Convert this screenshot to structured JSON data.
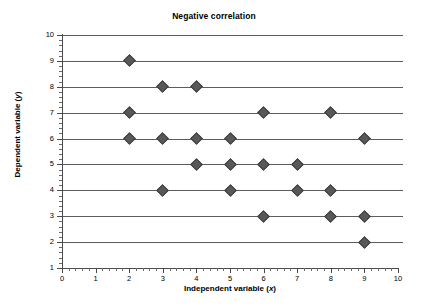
{
  "chart_data": {
    "type": "scatter",
    "title": "Negative correlation",
    "xlabel": "Independent variable (x)",
    "ylabel": "Dependent variable (y)",
    "xlabel_text": "Independent variable (",
    "xlabel_var": "x",
    "ylabel_text": "Dependent variable (",
    "ylabel_var": "y",
    "label_close": ")",
    "xlim": [
      0,
      10
    ],
    "ylim": [
      1,
      10
    ],
    "x_ticks": [
      0,
      1,
      2,
      3,
      4,
      5,
      6,
      7,
      8,
      9,
      10
    ],
    "y_ticks": [
      1,
      2,
      3,
      4,
      5,
      6,
      7,
      8,
      9,
      10
    ],
    "x_minor_ticks_between": 4,
    "y_minor_ticks_between": 4,
    "grid": "horizontal",
    "gridlines_at_y": [
      2,
      3,
      4,
      5,
      6,
      7,
      8,
      9,
      10
    ],
    "legend": "none",
    "marker": "diamond",
    "marker_color": "#585858",
    "marker_edge_color": "#3d3d3d",
    "grid_color": "#5c5c5c",
    "axis_color": "#4a4a4a",
    "background": "#ffffff",
    "point_count": 23,
    "points": [
      {
        "x": 2,
        "y": 9
      },
      {
        "x": 3,
        "y": 8
      },
      {
        "x": 4,
        "y": 8
      },
      {
        "x": 2,
        "y": 7
      },
      {
        "x": 6,
        "y": 7
      },
      {
        "x": 8,
        "y": 7
      },
      {
        "x": 2,
        "y": 6
      },
      {
        "x": 3,
        "y": 6
      },
      {
        "x": 4,
        "y": 6
      },
      {
        "x": 5,
        "y": 6
      },
      {
        "x": 9,
        "y": 6
      },
      {
        "x": 4,
        "y": 5
      },
      {
        "x": 5,
        "y": 5
      },
      {
        "x": 6,
        "y": 5
      },
      {
        "x": 7,
        "y": 5
      },
      {
        "x": 3,
        "y": 4
      },
      {
        "x": 5,
        "y": 4
      },
      {
        "x": 7,
        "y": 4
      },
      {
        "x": 8,
        "y": 4
      },
      {
        "x": 6,
        "y": 3
      },
      {
        "x": 8,
        "y": 3
      },
      {
        "x": 9,
        "y": 3
      },
      {
        "x": 9,
        "y": 2
      }
    ]
  }
}
